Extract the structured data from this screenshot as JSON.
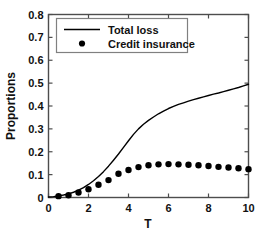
{
  "chart_data": {
    "type": "line",
    "title": "",
    "xlabel": "T",
    "ylabel": "Proportions",
    "xlim": [
      0,
      10
    ],
    "ylim": [
      0,
      0.8
    ],
    "xticks": [
      0,
      2,
      4,
      6,
      8,
      10
    ],
    "yticks": [
      0,
      0.1,
      0.2,
      0.3,
      0.4,
      0.5,
      0.6,
      0.7,
      0.8
    ],
    "xtick_labels": [
      "0",
      "2",
      "4",
      "6",
      "8",
      "10"
    ],
    "ytick_labels": [
      "0",
      "0.1",
      "0.2",
      "0.3",
      "0.4",
      "0.5",
      "0.6",
      "0.7",
      "0.8"
    ],
    "grid": false,
    "legend_position": "top-left",
    "series": [
      {
        "name": "Total loss",
        "style": "line",
        "color": "#000000",
        "x": [
          0,
          0.25,
          0.5,
          0.75,
          1.0,
          1.25,
          1.5,
          1.75,
          2.0,
          2.25,
          2.5,
          2.75,
          3.0,
          3.25,
          3.5,
          3.75,
          4.0,
          4.25,
          4.5,
          4.75,
          5.0,
          5.25,
          5.5,
          5.75,
          6.0,
          6.25,
          6.5,
          6.75,
          7.0,
          7.25,
          7.5,
          7.75,
          8.0,
          8.25,
          8.5,
          8.75,
          9.0,
          9.25,
          9.5,
          9.75,
          10.0
        ],
        "y": [
          0.002,
          0.004,
          0.007,
          0.011,
          0.016,
          0.023,
          0.032,
          0.043,
          0.057,
          0.073,
          0.092,
          0.113,
          0.137,
          0.163,
          0.19,
          0.219,
          0.248,
          0.276,
          0.3,
          0.32,
          0.337,
          0.352,
          0.366,
          0.378,
          0.389,
          0.398,
          0.407,
          0.414,
          0.421,
          0.428,
          0.434,
          0.44,
          0.446,
          0.452,
          0.457,
          0.463,
          0.469,
          0.475,
          0.481,
          0.488,
          0.495
        ]
      },
      {
        "name": "Credit insurance",
        "style": "markers",
        "marker": "dot",
        "color": "#000000",
        "x": [
          0.5,
          1.0,
          1.5,
          2.0,
          2.5,
          3.0,
          3.5,
          4.0,
          4.5,
          5.0,
          5.5,
          6.0,
          6.5,
          7.0,
          7.5,
          8.0,
          8.5,
          9.0,
          9.5,
          10.0
        ],
        "y": [
          0.006,
          0.01,
          0.022,
          0.036,
          0.056,
          0.076,
          0.104,
          0.12,
          0.133,
          0.141,
          0.145,
          0.146,
          0.145,
          0.143,
          0.141,
          0.138,
          0.134,
          0.131,
          0.128,
          0.124
        ]
      }
    ]
  },
  "legend": {
    "entries": [
      {
        "label": "Total loss",
        "marker": "line"
      },
      {
        "label": "Credit insurance",
        "marker": "dot"
      }
    ]
  },
  "axes": {
    "x_title": "T",
    "y_title": "Proportions"
  }
}
